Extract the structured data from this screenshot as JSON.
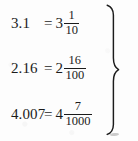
{
  "figure": {
    "ink_color": "#1b1b1b",
    "background_color": "#fdfdfd",
    "grouping_symbol": "}",
    "rows": [
      {
        "decimal": "3.1",
        "equals": "=",
        "whole": "3",
        "numerator": "1",
        "denominator": "10"
      },
      {
        "decimal": "2.16",
        "equals": "=",
        "whole": "2",
        "numerator": "16",
        "denominator": "100"
      },
      {
        "decimal": "4.007",
        "equals": "=",
        "whole": "4",
        "numerator": "7",
        "denominator": "1000"
      }
    ]
  }
}
